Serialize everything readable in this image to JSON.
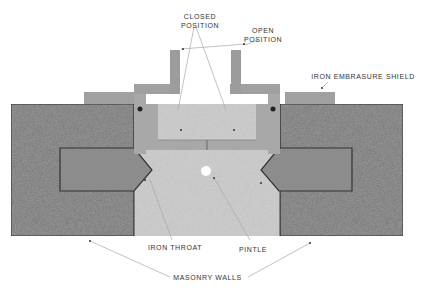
{
  "labels": {
    "closed_position": [
      "Closed",
      "Position"
    ],
    "open_position": [
      "Open",
      "Position"
    ],
    "iron_embrasure_shield": "Iron Embrasure Shield",
    "iron_throat": "Iron Throat",
    "pintle": "Pintle",
    "masonry_walls": "Masonry Walls"
  },
  "colors": {
    "masonry": "#9a9a9a",
    "masonry_dark": "#7d7d7d",
    "throat_fill": "#cfcfcf",
    "iron": "#8c8c8c",
    "iron_light": "#a8a8a8",
    "outline": "#3a3a3a",
    "leader": "#aaaaaa",
    "text": "#333333"
  }
}
